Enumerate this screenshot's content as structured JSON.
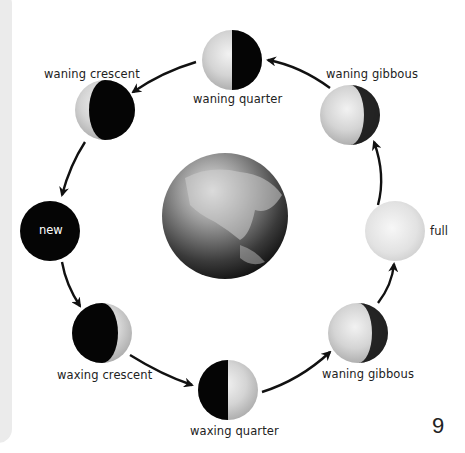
{
  "diagram": {
    "center": {
      "name": "Earth"
    },
    "phases": [
      {
        "id": "waning-quarter-top",
        "label": "waning quarter",
        "cx": 232,
        "cy": 60,
        "r": 30
      },
      {
        "id": "waning-gibbous-top",
        "label": "waning gibbous",
        "cx": 350,
        "cy": 115,
        "r": 30
      },
      {
        "id": "full",
        "label": "full",
        "cx": 395,
        "cy": 231,
        "r": 30
      },
      {
        "id": "waning-gibbous-bottom",
        "label": "waning gibbous",
        "cx": 358,
        "cy": 333,
        "r": 30
      },
      {
        "id": "waxing-quarter",
        "label": "waxing quarter",
        "cx": 228,
        "cy": 390,
        "r": 30
      },
      {
        "id": "waxing-crescent",
        "label": "waxing crescent",
        "cx": 102,
        "cy": 333,
        "r": 30
      },
      {
        "id": "new",
        "label": "new",
        "cx": 50,
        "cy": 231,
        "r": 30
      },
      {
        "id": "waning-crescent",
        "label": "waning crescent",
        "cx": 105,
        "cy": 110,
        "r": 30
      }
    ]
  },
  "page": {
    "number": "9"
  },
  "colors": {
    "moon_light": "#d9d9d9",
    "moon_dark": "#050505",
    "arrow": "#111111",
    "panel": "#ebebeb"
  }
}
